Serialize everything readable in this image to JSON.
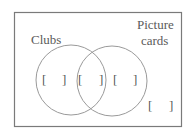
{
  "diagram": {
    "type": "venn",
    "frame": {
      "x": 14,
      "y": 12,
      "width": 167,
      "height": 114,
      "stroke": "#7a7a7a"
    },
    "sets": [
      {
        "label": "Clubs",
        "circle": {
          "cx": 71,
          "cy": 80,
          "r": 35
        },
        "label_lines": [
          "Clubs"
        ]
      },
      {
        "label": "Picture cards",
        "circle": {
          "cx": 112,
          "cy": 81,
          "r": 35
        },
        "label_lines": [
          "Picture",
          "cards"
        ]
      }
    ],
    "regions": [
      {
        "name": "clubs-only",
        "open": "[",
        "close": "]",
        "value": ""
      },
      {
        "name": "intersection",
        "open": "[",
        "close": "]",
        "value": ""
      },
      {
        "name": "picture-cards-only",
        "open": "[",
        "close": "]",
        "value": ""
      },
      {
        "name": "outside",
        "open": "[",
        "close": "]",
        "value": ""
      }
    ],
    "colors": {
      "circle_stroke": "#9a9a9a",
      "frame_stroke": "#7a7a7a",
      "text": "#5a5a5a",
      "background": "#ffffff"
    }
  }
}
